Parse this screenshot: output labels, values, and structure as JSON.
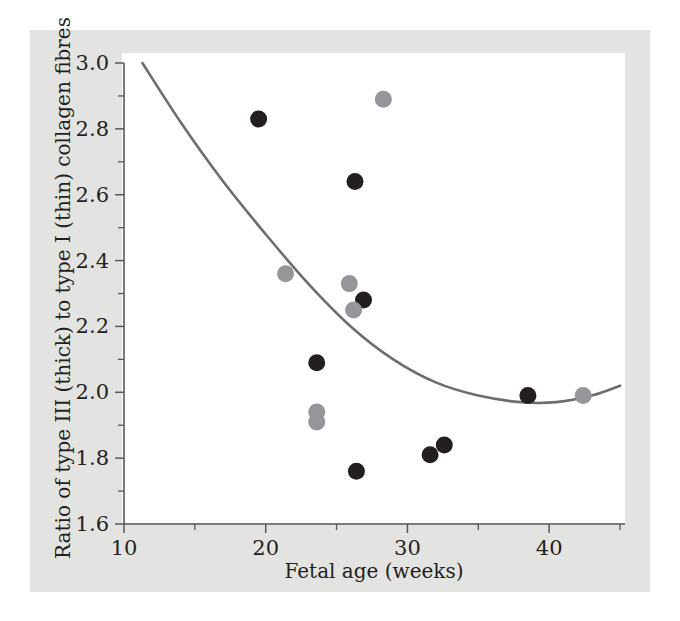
{
  "figure": {
    "background_color": "#ffffff",
    "panel_color": "#e3e3e1",
    "plot_background_color": "#ffffff"
  },
  "chart_data": {
    "type": "scatter",
    "title": "",
    "xlabel": "Fetal age (weeks)",
    "ylabel": "Ratio of type III (thick) to type I (thin) collagen fibres",
    "xlim": [
      10,
      45
    ],
    "ylim": [
      1.6,
      3.0
    ],
    "grid": false,
    "legend": "none",
    "x_ticks_major": [
      10,
      20,
      30,
      40
    ],
    "x_ticks_major_labels": [
      "10",
      "20",
      "30",
      "40"
    ],
    "x_ticks_minor": [
      15,
      25,
      35,
      45
    ],
    "y_ticks_major": [
      1.6,
      1.8,
      2.0,
      2.2,
      2.4,
      2.6,
      2.8,
      3.0
    ],
    "y_ticks_major_labels": [
      "1.6",
      "1.8",
      "2.0",
      "2.2",
      "2.4",
      "2.6",
      "2.8",
      "3.0"
    ],
    "y_ticks_minor": [
      1.7,
      1.9,
      2.1,
      2.3,
      2.5,
      2.7,
      2.9
    ],
    "series": [
      {
        "name": "dark markers",
        "marker": "circle",
        "color": "#231f20",
        "points": [
          {
            "x": 19.5,
            "y": 2.83
          },
          {
            "x": 26.3,
            "y": 2.64
          },
          {
            "x": 26.9,
            "y": 2.28
          },
          {
            "x": 23.6,
            "y": 2.09
          },
          {
            "x": 26.4,
            "y": 1.76
          },
          {
            "x": 31.6,
            "y": 1.81
          },
          {
            "x": 32.6,
            "y": 1.84
          },
          {
            "x": 38.5,
            "y": 1.99
          }
        ]
      },
      {
        "name": "grey markers",
        "marker": "circle",
        "color": "#95959a",
        "points": [
          {
            "x": 28.3,
            "y": 2.89
          },
          {
            "x": 21.4,
            "y": 2.36
          },
          {
            "x": 25.9,
            "y": 2.33
          },
          {
            "x": 26.2,
            "y": 2.25
          },
          {
            "x": 23.6,
            "y": 1.94
          },
          {
            "x": 23.6,
            "y": 1.91
          },
          {
            "x": 42.4,
            "y": 1.99
          }
        ]
      }
    ],
    "fit_curve": {
      "name": "fitted quadratic trend",
      "color": "#6d6d6f",
      "points": [
        {
          "x": 11.3,
          "y": 3.0
        },
        {
          "x": 14.0,
          "y": 2.82
        },
        {
          "x": 17.0,
          "y": 2.64
        },
        {
          "x": 20.0,
          "y": 2.48
        },
        {
          "x": 23.0,
          "y": 2.33
        },
        {
          "x": 26.0,
          "y": 2.2
        },
        {
          "x": 29.0,
          "y": 2.1
        },
        {
          "x": 32.0,
          "y": 2.03
        },
        {
          "x": 35.0,
          "y": 1.99
        },
        {
          "x": 38.0,
          "y": 1.97
        },
        {
          "x": 40.5,
          "y": 1.97
        },
        {
          "x": 43.0,
          "y": 1.99
        },
        {
          "x": 45.0,
          "y": 2.02
        }
      ]
    }
  },
  "colors": {
    "dark_marker": "#231f20",
    "grey_marker": "#95959a",
    "curve": "#6d6d6f",
    "axis": "#58585a",
    "panel": "#e3e3e1"
  }
}
